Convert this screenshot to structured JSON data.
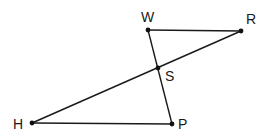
{
  "diagram": {
    "type": "geometry",
    "points": {
      "W": {
        "x": 148,
        "y": 30,
        "label": "W",
        "lx": 141,
        "ly": 22
      },
      "R": {
        "x": 241,
        "y": 31,
        "label": "R",
        "lx": 246,
        "ly": 24
      },
      "S": {
        "x": 158,
        "y": 68,
        "label": "S",
        "lx": 165,
        "ly": 81
      },
      "H": {
        "x": 32,
        "y": 123,
        "label": "H",
        "lx": 13,
        "ly": 129
      },
      "P": {
        "x": 172,
        "y": 124,
        "label": "P",
        "lx": 178,
        "ly": 129
      }
    },
    "segments": [
      {
        "from": "W",
        "to": "R"
      },
      {
        "from": "W",
        "to": "P"
      },
      {
        "from": "R",
        "to": "H"
      },
      {
        "from": "H",
        "to": "P"
      }
    ],
    "colors": {
      "stroke": "#1a1a1a",
      "point": "#111111",
      "background": "#ffffff"
    }
  }
}
